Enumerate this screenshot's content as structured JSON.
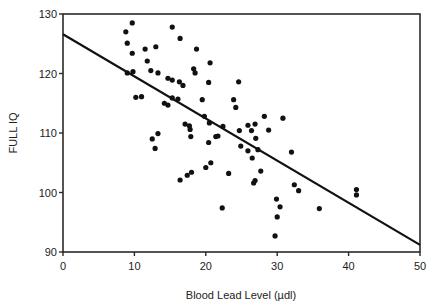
{
  "chart_data": {
    "type": "scatter",
    "title": "",
    "xlabel": "Blood Lead Level (µdl)",
    "ylabel": "FULL IQ",
    "xlim": [
      0,
      50
    ],
    "ylim": [
      90,
      130
    ],
    "xticks": [
      0,
      10,
      20,
      30,
      40,
      50
    ],
    "yticks": [
      90,
      100,
      110,
      120,
      130
    ],
    "grid": false,
    "legend": null,
    "series": [
      {
        "name": "observations",
        "marker": "filled-circle",
        "color": "#111111",
        "points": [
          [
            8.8,
            127.0
          ],
          [
            9.7,
            128.5
          ],
          [
            9.0,
            125.1
          ],
          [
            11.5,
            124.1
          ],
          [
            11.8,
            122.1
          ],
          [
            13.0,
            124.5
          ],
          [
            9.7,
            123.4
          ],
          [
            15.3,
            127.8
          ],
          [
            16.4,
            125.9
          ],
          [
            9.0,
            120.1
          ],
          [
            9.8,
            120.3
          ],
          [
            12.3,
            120.5
          ],
          [
            13.3,
            120.1
          ],
          [
            14.7,
            119.2
          ],
          [
            15.3,
            118.9
          ],
          [
            16.3,
            118.6
          ],
          [
            16.8,
            118.0
          ],
          [
            18.3,
            120.8
          ],
          [
            18.5,
            120.1
          ],
          [
            18.7,
            124.1
          ],
          [
            20.6,
            121.8
          ],
          [
            20.4,
            118.5
          ],
          [
            10.2,
            116.0
          ],
          [
            11.0,
            116.1
          ],
          [
            14.2,
            115.0
          ],
          [
            14.7,
            114.7
          ],
          [
            15.3,
            115.9
          ],
          [
            16.1,
            115.7
          ],
          [
            19.5,
            115.6
          ],
          [
            19.8,
            112.8
          ],
          [
            20.5,
            111.7
          ],
          [
            17.1,
            111.5
          ],
          [
            17.7,
            111.2
          ],
          [
            17.8,
            110.6
          ],
          [
            17.9,
            109.4
          ],
          [
            21.4,
            109.4
          ],
          [
            21.7,
            109.5
          ],
          [
            20.4,
            108.4
          ],
          [
            12.5,
            109.0
          ],
          [
            13.3,
            109.9
          ],
          [
            12.9,
            107.4
          ],
          [
            23.9,
            115.6
          ],
          [
            24.2,
            114.3
          ],
          [
            24.6,
            118.6
          ],
          [
            25.9,
            111.3
          ],
          [
            26.9,
            111.5
          ],
          [
            25.9,
            107.0
          ],
          [
            27.3,
            107.2
          ],
          [
            27.0,
            109.1
          ],
          [
            28.8,
            110.5
          ],
          [
            28.2,
            112.8
          ],
          [
            26.4,
            110.4
          ],
          [
            22.4,
            111.1
          ],
          [
            24.7,
            110.4
          ],
          [
            24.9,
            107.8
          ],
          [
            26.5,
            105.8
          ],
          [
            30.8,
            112.5
          ],
          [
            16.4,
            102.1
          ],
          [
            17.4,
            102.9
          ],
          [
            18.0,
            103.4
          ],
          [
            20.0,
            104.2
          ],
          [
            20.7,
            105.0
          ],
          [
            23.2,
            103.2
          ],
          [
            27.7,
            103.6
          ],
          [
            26.9,
            102.0
          ],
          [
            26.7,
            101.6
          ],
          [
            22.3,
            97.4
          ],
          [
            32.0,
            106.8
          ],
          [
            32.4,
            101.3
          ],
          [
            33.0,
            100.3
          ],
          [
            29.9,
            98.9
          ],
          [
            30.4,
            97.6
          ],
          [
            30.0,
            95.9
          ],
          [
            29.7,
            92.7
          ],
          [
            35.9,
            97.3
          ],
          [
            41.1,
            100.5
          ],
          [
            41.1,
            99.6
          ]
        ]
      },
      {
        "name": "regression line",
        "type": "line",
        "color": "#111111",
        "points": [
          [
            0,
            126.6
          ],
          [
            50,
            91.2
          ]
        ]
      }
    ]
  }
}
